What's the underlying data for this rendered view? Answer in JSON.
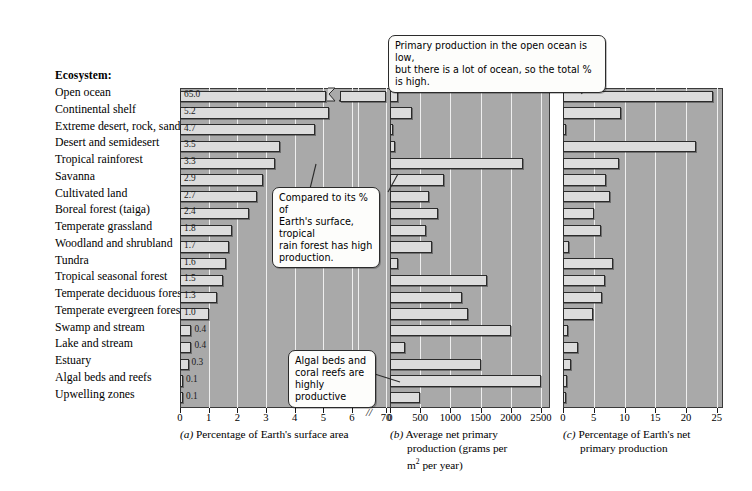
{
  "figure": {
    "header": "Ecosystem:",
    "ecosystems": [
      "Open ocean",
      "Continental shelf",
      "Extreme desert, rock, sand, ice",
      "Desert and semidesert",
      "Tropical rainforest",
      "Savanna",
      "Cultivated land",
      "Boreal forest (taiga)",
      "Temperate grassland",
      "Woodland and shrubland",
      "Tundra",
      "Tropical seasonal forest",
      "Temperate deciduous forest",
      "Temperate evergreen forest",
      "Swamp and stream",
      "Lake and stream",
      "Estuary",
      "Algal beds and reefs",
      "Upwelling zones"
    ],
    "callouts": [
      {
        "id": "open-ocean-callout",
        "line1": "Primary production in the open ocean is low,",
        "line2": "but there is a lot of ocean, so the total % is high."
      },
      {
        "id": "rainforest-callout",
        "line1": "Compared to its % of",
        "line2": "Earth's surface, tropical",
        "line3": "rain forest has high",
        "line4": "production."
      },
      {
        "id": "algal-beds-callout",
        "line1": "Algal beds and",
        "line2": "coral reefs are",
        "line3": "highly productive"
      }
    ],
    "panel_captions": {
      "a": {
        "letter": "(a)",
        "text": "Percentage of Earth's surface area"
      },
      "b": {
        "letter": "(b)",
        "line1": "Average net primary",
        "line2": "production (grams per",
        "line3_pre": "m",
        "line3_sup": "2",
        "line3_post": " per year)"
      },
      "c": {
        "letter": "(c)",
        "line1": "Percentage of Earth's net",
        "line2": "primary production"
      }
    },
    "colors": {
      "plot_background": "#a9a9a9",
      "bar_fill": "#dcdcdc",
      "bar_stroke": "#2b2b2b",
      "gridline": "#efefef",
      "callout_fill": "#fdfdfb",
      "text": "#000000"
    }
  },
  "chart_data": [
    {
      "id": "panel-a",
      "type": "bar",
      "orientation": "horizontal",
      "title": "Percentage of Earth's surface area",
      "xlabel": "Percentage of Earth's surface area",
      "ylabel": "Ecosystem",
      "xlim": [
        0,
        6
      ],
      "axis_break": {
        "after": 6,
        "resumes_at": 70,
        "label": "70"
      },
      "ticks": [
        0,
        1,
        2,
        3,
        4,
        5,
        6,
        70
      ],
      "tick_labels": [
        "0",
        "1",
        "2",
        "3",
        "4",
        "5",
        "6",
        "70"
      ],
      "grid": true,
      "data_labels": true,
      "categories": [
        "Open ocean",
        "Continental shelf",
        "Extreme desert, rock, sand, ice",
        "Desert and semidesert",
        "Tropical rainforest",
        "Savanna",
        "Cultivated land",
        "Boreal forest (taiga)",
        "Temperate grassland",
        "Woodland and shrubland",
        "Tundra",
        "Tropical seasonal forest",
        "Temperate deciduous forest",
        "Temperate evergreen forest",
        "Swamp and stream",
        "Lake and stream",
        "Estuary",
        "Algal beds and reefs",
        "Upwelling zones"
      ],
      "values": [
        65.0,
        5.2,
        4.7,
        3.5,
        3.3,
        2.9,
        2.7,
        2.4,
        1.8,
        1.7,
        1.6,
        1.5,
        1.3,
        1.0,
        0.4,
        0.4,
        0.3,
        0.1,
        0.1
      ],
      "value_labels": [
        "65.0",
        "5.2",
        "4.7",
        "3.5",
        "3.3",
        "2.9",
        "2.7",
        "2.4",
        "1.8",
        "1.7",
        "1.6",
        "1.5",
        "1.3",
        "1.0",
        "0.4",
        "0.4",
        "0.3",
        "0.1",
        "0.1"
      ]
    },
    {
      "id": "panel-b",
      "type": "bar",
      "orientation": "horizontal",
      "title": "Average net primary production (grams per m2 per year)",
      "xlabel": "Average net primary production (grams per m2 per year)",
      "ylabel": "Ecosystem",
      "xlim": [
        0,
        2650
      ],
      "ticks": [
        0,
        500,
        1000,
        1500,
        2000,
        2500
      ],
      "tick_labels": [
        "0",
        "500",
        "1000",
        "1500",
        "2000",
        "2500"
      ],
      "grid": true,
      "data_labels": false,
      "categories": [
        "Open ocean",
        "Continental shelf",
        "Extreme desert, rock, sand, ice",
        "Desert and semidesert",
        "Tropical rainforest",
        "Savanna",
        "Cultivated land",
        "Boreal forest (taiga)",
        "Temperate grassland",
        "Woodland and shrubland",
        "Tundra",
        "Tropical seasonal forest",
        "Temperate deciduous forest",
        "Temperate evergreen forest",
        "Swamp and stream",
        "Lake and stream",
        "Estuary",
        "Algal beds and reefs",
        "Upwelling zones"
      ],
      "values": [
        125,
        360,
        3,
        90,
        2200,
        900,
        650,
        800,
        600,
        700,
        140,
        1600,
        1200,
        1300,
        2000,
        250,
        1500,
        2500,
        500
      ]
    },
    {
      "id": "panel-c",
      "type": "bar",
      "orientation": "horizontal",
      "title": "Percentage of Earth's net primary production",
      "xlabel": "Percentage of Earth's net primary production",
      "ylabel": "Ecosystem",
      "xlim": [
        0,
        26
      ],
      "ticks": [
        0,
        5,
        10,
        15,
        20,
        25
      ],
      "tick_labels": [
        "0",
        "5",
        "10",
        "15",
        "20",
        "25"
      ],
      "grid": true,
      "data_labels": false,
      "categories": [
        "Open ocean",
        "Continental shelf",
        "Extreme desert, rock, sand, ice",
        "Desert and semidesert",
        "Tropical rainforest",
        "Savanna",
        "Cultivated land",
        "Boreal forest (taiga)",
        "Temperate grassland",
        "Woodland and shrubland",
        "Tundra",
        "Tropical seasonal forest",
        "Temperate deciduous forest",
        "Temperate evergreen forest",
        "Swamp and stream",
        "Lake and stream",
        "Estuary",
        "Algal beds and reefs",
        "Upwelling zones"
      ],
      "values": [
        24.4,
        9.4,
        0.4,
        21.6,
        9.1,
        7.0,
        7.6,
        5.1,
        6.1,
        1.0,
        8.2,
        6.9,
        6.3,
        4.9,
        0.8,
        2.5,
        1.3,
        0.6,
        0.1
      ]
    }
  ]
}
